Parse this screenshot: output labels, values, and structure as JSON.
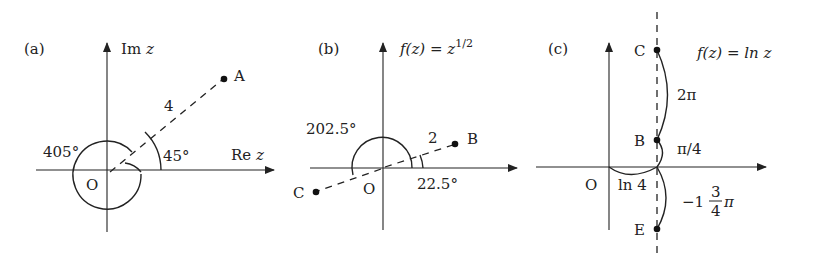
{
  "figure": {
    "panels": [
      {
        "id": "a",
        "label": "(a)",
        "axis_x_label": "Re",
        "axis_x_var": "z",
        "axis_y_label": "Im",
        "axis_y_var": "z",
        "origin_label": "O",
        "point": {
          "name": "A",
          "modulus_label": "4"
        },
        "angles": {
          "small": "45°",
          "large": "405°"
        }
      },
      {
        "id": "b",
        "label": "(b)",
        "function_label": "f(z) = z",
        "function_exponent": "1/2",
        "origin_label": "O",
        "points": [
          {
            "name": "B",
            "modulus_label": "2"
          },
          {
            "name": "C"
          }
        ],
        "angles": {
          "small": "22.5°",
          "large": "202.5°"
        }
      },
      {
        "id": "c",
        "label": "(c)",
        "function_label": "f(z) = ln z",
        "origin_label": "O",
        "points": [
          {
            "name": "C"
          },
          {
            "name": "B"
          },
          {
            "name": "E"
          }
        ],
        "real_part_label": "ln 4",
        "segment_labels": {
          "CB": "2π",
          "B": "π/4",
          "E_whole": "−1",
          "E_frac_num": "3",
          "E_frac_den": "4",
          "E_pi": "π"
        }
      }
    ]
  }
}
